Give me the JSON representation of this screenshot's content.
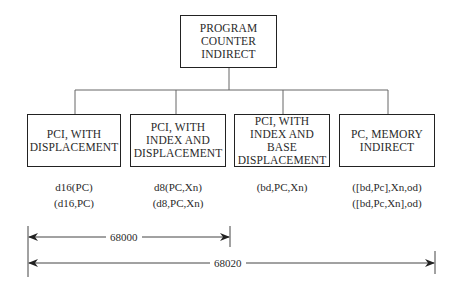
{
  "root": {
    "label": "PROGRAM\nCOUNTER\nINDIRECT"
  },
  "modes": [
    {
      "label": "PCI, WITH\nDISPLACEMENT",
      "syntax": "d16(PC)\n(d16,PC)"
    },
    {
      "label": "PCI, WITH\nINDEX AND\nDISPLACEMENT",
      "syntax": "d8(PC,Xn)\n(d8,PC,Xn)"
    },
    {
      "label": "PCI, WITH\nINDEX AND BASE\nDISPLACEMENT",
      "syntax": "(bd,PC,Xn)"
    },
    {
      "label": "PC, MEMORY\nINDIRECT",
      "syntax": "([bd,Pc],Xn,od)\n([bd,Pc,Xn],od)"
    }
  ],
  "ranges": [
    {
      "label": "68000",
      "spans": "first two modes"
    },
    {
      "label": "68020",
      "spans": "all four modes"
    }
  ]
}
